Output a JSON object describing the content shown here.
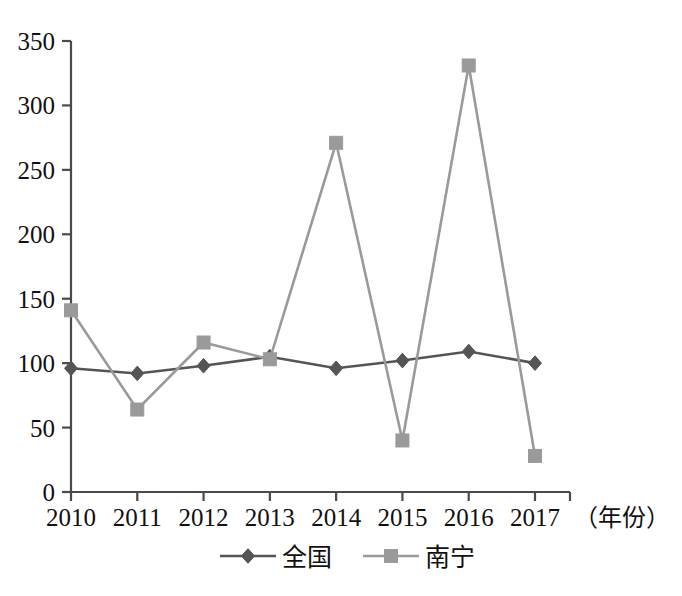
{
  "chart_data": {
    "type": "line",
    "title": "",
    "xlabel": "（年份）",
    "ylabel": "",
    "categories": [
      "2010",
      "2011",
      "2012",
      "2013",
      "2014",
      "2015",
      "2016",
      "2017"
    ],
    "x": [
      2010,
      2011,
      2012,
      2013,
      2014,
      2015,
      2016,
      2017
    ],
    "series": [
      {
        "name": "全国",
        "color": "#555555",
        "marker": "diamond",
        "values": [
          96,
          92,
          98,
          105,
          96,
          102,
          109,
          100
        ]
      },
      {
        "name": "南宁",
        "color": "#9a9a9a",
        "marker": "square",
        "values": [
          141,
          64,
          116,
          103,
          271,
          40,
          331,
          28
        ]
      }
    ],
    "ylim": [
      0,
      350
    ],
    "yticks": [
      0,
      50,
      100,
      150,
      200,
      250,
      300,
      350
    ],
    "ytick_labels": [
      "0",
      "50",
      "100",
      "150",
      "200",
      "250",
      "300",
      "350"
    ],
    "grid": false,
    "legend_position": "bottom"
  },
  "axis": {
    "x_unit_label": "（年份）"
  },
  "legend": {
    "entries": [
      {
        "label": "全国",
        "color": "#555555",
        "marker": "diamond"
      },
      {
        "label": "南宁",
        "color": "#9a9a9a",
        "marker": "square"
      }
    ]
  },
  "colors": {
    "series_national": "#555555",
    "series_nanning": "#9a9a9a",
    "axis": "#4a4a4a",
    "text": "#111111",
    "background": "#ffffff"
  }
}
